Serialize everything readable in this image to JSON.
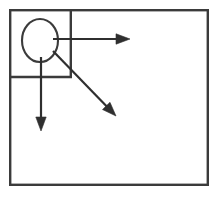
{
  "figure": {
    "title": "",
    "background_color": "#ffffff",
    "stroke_color": "#3b3b3b",
    "arrow_color": "#2f2f2f",
    "caption": ""
  },
  "shapes": {
    "outer_rectangle": {
      "name": "outer boundary rectangle",
      "x": 9,
      "y": 9,
      "width": 200,
      "height": 177,
      "label": ""
    },
    "inner_rectangle": {
      "name": "upper left quadrant rectangle",
      "x": 9,
      "y": 9,
      "width": 63,
      "height": 68,
      "label": ""
    },
    "ellipse": {
      "name": "ellipse node",
      "cx": 40,
      "cy": 40.5,
      "rx": 18,
      "ry": 21.5,
      "label": ""
    }
  },
  "arrows": [
    {
      "id": "arrow-right",
      "name": "horizontal rightward arrow",
      "x1": 53,
      "y1": 39,
      "x2": 130,
      "y2": 39,
      "direction": "right",
      "label": ""
    },
    {
      "id": "arrow-down",
      "name": "vertical downward arrow",
      "x1": 41,
      "y1": 57,
      "x2": 41,
      "y2": 131,
      "direction": "down",
      "label": ""
    },
    {
      "id": "arrow-diagonal",
      "name": "diagonal down right arrow",
      "x1": 53,
      "y1": 51,
      "x2": 116,
      "y2": 116,
      "direction": "down-right",
      "label": ""
    }
  ]
}
